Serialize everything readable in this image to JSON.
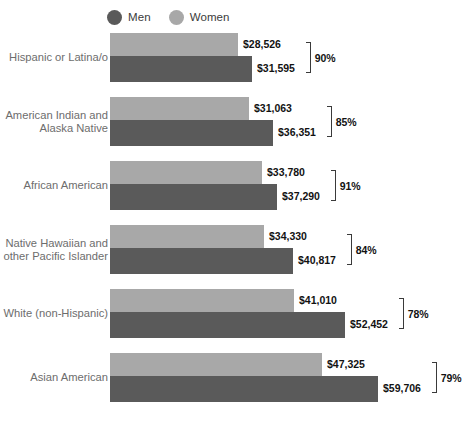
{
  "chart_data": {
    "type": "bar",
    "orientation": "horizontal",
    "title": "",
    "xlabel": "",
    "ylabel": "",
    "grid": false,
    "legend_position": "top",
    "xlim": [
      0,
      59706
    ],
    "categories": [
      "Hispanic or Latina/o",
      "American Indian and\nAlaska Native",
      "African American",
      "Native Hawaiian and\nother Pacific Islander",
      "White (non-Hispanic)",
      "Asian American"
    ],
    "series": [
      {
        "name": "Men",
        "color": "#5a5a5a",
        "values": [
          31595,
          36351,
          37290,
          40817,
          52452,
          59706
        ],
        "value_labels": [
          "$31,595",
          "$36,351",
          "$37,290",
          "$40,817",
          "$52,452",
          "$59,706"
        ]
      },
      {
        "name": "Women",
        "color": "#a8a8a8",
        "values": [
          28526,
          31063,
          33780,
          34330,
          41010,
          47325
        ],
        "value_labels": [
          "$28,526",
          "$31,063",
          "$33,780",
          "$34,330",
          "$41,010",
          "$47,325"
        ]
      }
    ],
    "annotations": {
      "label": "women-to-men earnings ratio",
      "values": [
        "90%",
        "85%",
        "91%",
        "84%",
        "78%",
        "79%"
      ]
    }
  },
  "legend": {
    "items": [
      {
        "label": "Men",
        "marker": "circle-marker-men",
        "color": "#5a5a5a"
      },
      {
        "label": "Women",
        "marker": "circle-marker-women",
        "color": "#a8a8a8"
      }
    ]
  }
}
